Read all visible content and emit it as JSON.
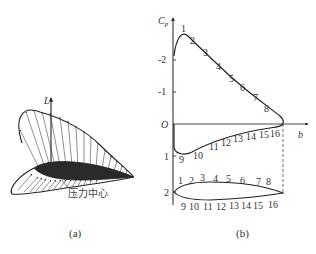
{
  "panel_a": {
    "caption": "(a)",
    "lift_label": "L",
    "center_of_pressure_label": "压力中心"
  },
  "panel_b": {
    "caption": "(b)",
    "y_axis_label": "C",
    "y_axis_subscript": "p",
    "x_axis_label": "b",
    "origin_label": "O",
    "y_ticks": [
      "-2",
      "-1",
      "1",
      "2"
    ],
    "upper_surface_points": [
      "1",
      "2",
      "3",
      "4",
      "5",
      "6",
      "7",
      "8"
    ],
    "lower_surface_points": [
      "9",
      "10",
      "11",
      "12",
      "13",
      "14",
      "15",
      "16"
    ],
    "airfoil_upper_points": [
      "1",
      "2",
      "3",
      "4",
      "5",
      "6",
      "7",
      "8"
    ],
    "airfoil_lower_points": [
      "9",
      "10",
      "11",
      "12",
      "13",
      "14",
      "15",
      "16"
    ]
  },
  "colors": {
    "line": "#222222",
    "text": "#333333",
    "fill": "#2a2a2a"
  }
}
